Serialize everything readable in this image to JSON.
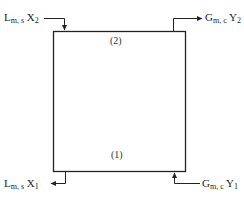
{
  "diagram": {
    "type": "countercurrent-stage-block",
    "box": {
      "x": 53,
      "y": 31,
      "width": 133,
      "height": 141,
      "stroke": "#222222"
    },
    "stages": {
      "top": "(2)",
      "bottom": "(1)"
    },
    "streams": {
      "liquid_in_top": {
        "main": "L",
        "sub": "m, s",
        "var": "X",
        "var_sub": "2",
        "direction": "in"
      },
      "gas_out_top": {
        "main": "G",
        "sub": "m, c",
        "var": "Y",
        "var_sub": "2",
        "direction": "out"
      },
      "liquid_out_bottom": {
        "main": "L",
        "sub": "m, s",
        "var": "X",
        "var_sub": "1",
        "direction": "out"
      },
      "gas_in_bottom": {
        "main": "G",
        "sub": "m, c",
        "var": "Y",
        "var_sub": "1",
        "direction": "in"
      }
    }
  }
}
